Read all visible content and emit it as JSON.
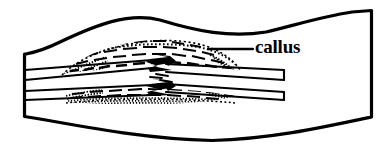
{
  "figure": {
    "name": "healing-bone-fracture-callus-diagram",
    "type": "anatomical-line-drawing",
    "background_color": "#ffffff",
    "ink_color": "#000000",
    "width": 391,
    "height": 159
  },
  "labels": [
    {
      "id": "callus",
      "text": "callus",
      "x": 255,
      "y": 36,
      "font_size": 19,
      "font_weight": "bold",
      "color": "#000000"
    }
  ],
  "leader_line": {
    "name": "callus-leader-line",
    "x1": 208,
    "y1": 49,
    "x2": 253,
    "y2": 49,
    "stroke": "#000000",
    "stroke_width": 2.2
  },
  "outline": {
    "name": "bone-shaft-outline",
    "stroke": "#000000",
    "stroke_width": 3.2,
    "fill": "none",
    "path": "M 24.5 54 L 24.5 116.5 L 40 119 C 90 128 150 139 212 140.5 C 270 139 320 128 371.5 117 L 371.5 10.5 L 352 12 C 320 17 292 26 266 32 C 230 38 196 31 160 20 C 128 12 96 25 60 42 C 48 48 36 52 26 54 Z"
  },
  "cortical_lines": {
    "name": "cortical-bone-lines",
    "stroke": "#000000",
    "stroke_width": 2.0,
    "left_segments": [
      {
        "id": "left-outer-upper",
        "x1": 25,
        "y1": 70,
        "x2": 150,
        "y2": 60
      },
      {
        "id": "left-inner-upper",
        "x1": 25,
        "y1": 80,
        "x2": 150,
        "y2": 68
      },
      {
        "id": "left-inner-lower",
        "x1": 25,
        "y1": 91,
        "x2": 150,
        "y2": 84
      },
      {
        "id": "left-outer-lower",
        "x1": 25,
        "y1": 100,
        "x2": 150,
        "y2": 95
      }
    ],
    "right_segments": [
      {
        "id": "right-outer-upper",
        "x1": 168,
        "y1": 64,
        "x2": 285,
        "y2": 70
      },
      {
        "id": "right-inner-upper",
        "x1": 168,
        "y1": 72,
        "x2": 285,
        "y2": 80
      },
      {
        "id": "right-inner-lower",
        "x1": 168,
        "y1": 84,
        "x2": 285,
        "y2": 92
      },
      {
        "id": "right-outer-lower",
        "x1": 168,
        "y1": 92,
        "x2": 285,
        "y2": 100
      }
    ]
  },
  "fracture_zone": {
    "name": "interlocking-zigzag-fracture",
    "x_range": [
      135,
      200
    ],
    "y_range": [
      58,
      98
    ],
    "description": "jagged interdigitating bone fragment ends"
  },
  "callus_texture": {
    "name": "callus-stipple-texture",
    "upper_band": {
      "x_range": [
        62,
        238
      ],
      "y_range": [
        40,
        72
      ],
      "density": "dense-dash-stipple"
    },
    "lower_band": {
      "x_range": [
        66,
        236
      ],
      "y_range": [
        88,
        104
      ],
      "density": "medium-dash-stipple"
    }
  }
}
